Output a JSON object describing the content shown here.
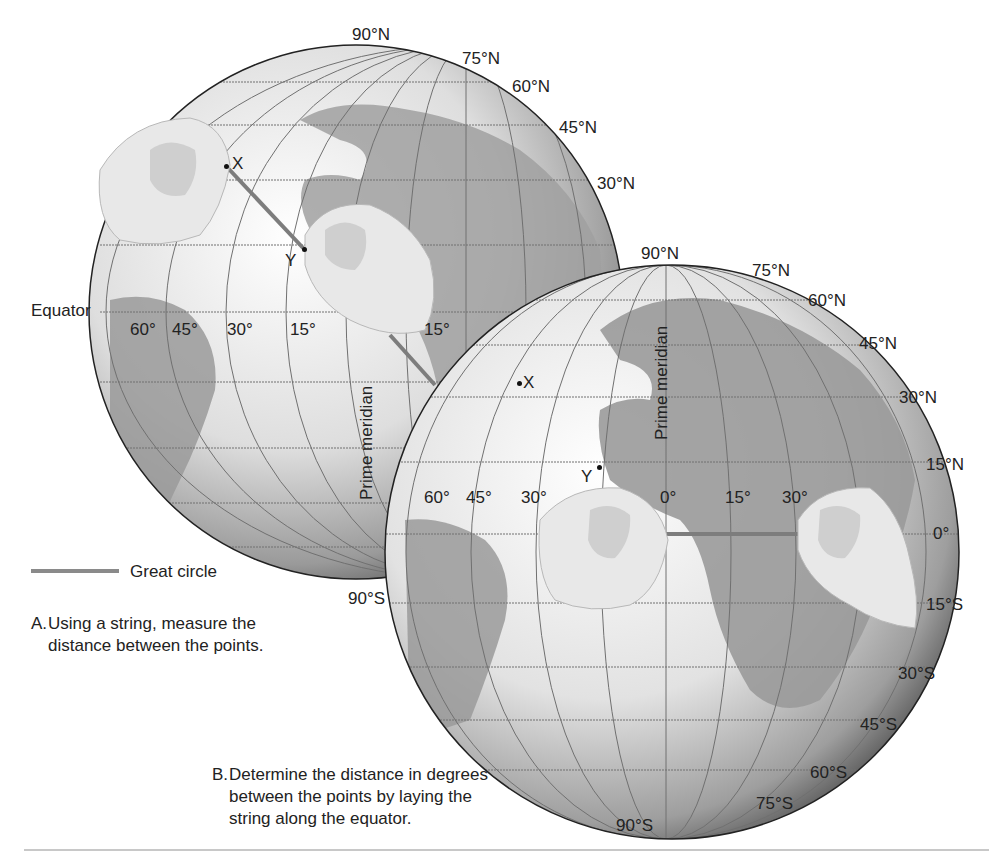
{
  "figure": {
    "globe_a": {
      "latitude_labels": [
        "90°N",
        "75°N",
        "60°N",
        "45°N",
        "30°N",
        "90°S"
      ],
      "longitude_labels": [
        "60°",
        "45°",
        "30°",
        "15°",
        "15°"
      ],
      "equator_label": "Equator",
      "prime_meridian_label": "Prime meridian",
      "point_x": "X",
      "point_y": "Y",
      "caption_letter": "A.",
      "caption_text": "Using a string, measure the distance between the points."
    },
    "globe_b": {
      "latitude_labels": [
        "90°N",
        "75°N",
        "60°N",
        "45°N",
        "30°N",
        "15°N",
        "0°",
        "15°S",
        "30°S",
        "45°S",
        "60°S",
        "75°S",
        "90°S"
      ],
      "longitude_labels": [
        "60°",
        "45°",
        "30°",
        "0°",
        "15°",
        "30°"
      ],
      "prime_meridian_label": "Prime meridian",
      "point_x": "X",
      "point_y": "Y",
      "caption_letter": "B.",
      "caption_text": "Determine the distance in degrees between the points by laying the string along the equator."
    },
    "legend": {
      "label": "Great circle",
      "line_color": "#8a8a8a"
    },
    "colors": {
      "ocean": "#f2f2f2",
      "land": "#9a9a9a",
      "globe_shadow": "#4a4a4a",
      "grid": "#707070",
      "string": "#7d7d7d",
      "hand": "#e6e6e6"
    }
  }
}
